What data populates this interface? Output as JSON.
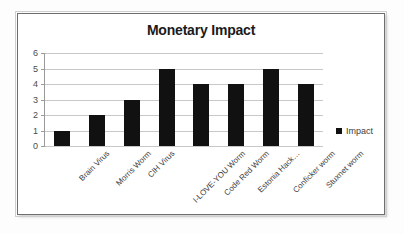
{
  "chart_data": {
    "type": "bar",
    "title": "Monetary Impact",
    "xlabel": "",
    "ylabel": "",
    "categories": [
      "Brain Virus",
      "Morris Worm",
      "CIH Virus",
      "I-LOVE-YOU Worm",
      "Code Red Worm",
      "Estonia Hack…",
      "Conficker worm",
      "Stuxnet worm"
    ],
    "series": [
      {
        "name": "Impact",
        "values": [
          1,
          2,
          3,
          5,
          4,
          4,
          5,
          4
        ],
        "color": "#111111"
      }
    ],
    "values": [
      1,
      2,
      3,
      5,
      4,
      4,
      5,
      4
    ],
    "ylim": [
      0,
      6
    ],
    "ytick_labels": [
      "6",
      "5",
      "4",
      "3",
      "2",
      "1",
      "0"
    ],
    "ytick_values": [
      6,
      5,
      4,
      3,
      2,
      1,
      0
    ],
    "grid": true,
    "legend_position": "right",
    "legend_entries": [
      "Impact"
    ]
  },
  "legend": {
    "label": "Impact"
  },
  "colors": {
    "bar": "#111111",
    "gridline": "#c8c8c8",
    "axis": "#9a9a9a",
    "frame": "#6e6e6e",
    "text": "#3d3d3d",
    "title": "#1b1b1b",
    "background": "#ffffff"
  }
}
